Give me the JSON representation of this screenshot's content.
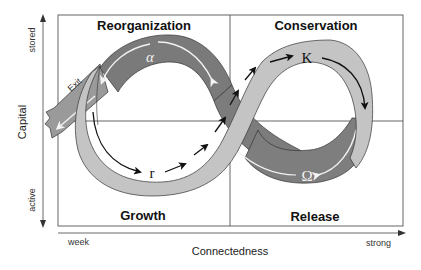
{
  "diagram": {
    "type": "adaptive-cycle",
    "quadrants": {
      "top_left": "Reorganization",
      "top_right": "Conservation",
      "bottom_left": "Growth",
      "bottom_right": "Release"
    },
    "y_axis": {
      "title": "Capital",
      "top_label": "stored",
      "bottom_label": "active"
    },
    "x_axis": {
      "title": "Connectedness",
      "left_label": "week",
      "right_label": "strong"
    },
    "phase_symbols": {
      "alpha": "α",
      "K": "K",
      "omega": "Ω",
      "r": "r"
    },
    "exit_label": "Exit",
    "colors": {
      "front_band": "#c4c4c4",
      "back_band": "#7a7a7a",
      "exit_band": "#9a9a9a",
      "outline": "#333333",
      "arrow_dark": "#111111",
      "arrow_light": "#f2f2f2"
    }
  }
}
